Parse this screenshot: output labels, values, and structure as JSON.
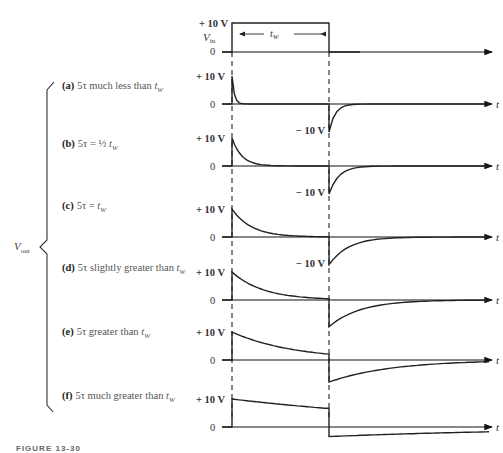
{
  "figure": {
    "caption_partial": "FIGURE 13-30",
    "time_axis_label": "t",
    "input": {
      "label": "V",
      "label_sub": "in",
      "high_label": "+ 10 V",
      "zero_label": "0",
      "width_label": "t",
      "width_label_sub": "W"
    },
    "output_label": "V",
    "output_label_sub": "out",
    "cases": [
      {
        "letter": "(a)",
        "text_pre": "5τ much less than ",
        "var": "t",
        "var_sub": "W",
        "high_label": "+ 10 V",
        "zero_label": "0",
        "neg_label": "− 10 V",
        "ratio": 0.12
      },
      {
        "letter": "(b)",
        "text_pre": "5τ  =  ½ ",
        "var": "t",
        "var_sub": "W",
        "high_label": "+ 10 V",
        "zero_label": "0",
        "neg_label": "− 10 V",
        "ratio": 0.5
      },
      {
        "letter": "(c)",
        "text_pre": "5τ  =  ",
        "var": "t",
        "var_sub": "W",
        "high_label": "+ 10 V",
        "zero_label": "0",
        "neg_label": "− 10 V",
        "ratio": 1.0
      },
      {
        "letter": "(d)",
        "text_pre": "5τ slightly greater than ",
        "var": "t",
        "var_sub": "W",
        "high_label": "+ 10 V",
        "zero_label": "0",
        "neg_label": "",
        "ratio": 1.6
      },
      {
        "letter": "(e)",
        "text_pre": "5τ greater than ",
        "var": "t",
        "var_sub": "W",
        "high_label": "+ 10 V",
        "zero_label": "0",
        "neg_label": "",
        "ratio": 3.2
      },
      {
        "letter": "(f)",
        "text_pre": "5τ much greater than ",
        "var": "t",
        "var_sub": "W",
        "high_label": "+ 10 V",
        "zero_label": "0",
        "neg_label": "",
        "ratio": 12
      }
    ]
  },
  "chart_data": {
    "type": "line",
    "xlabel": "t",
    "ylabel": "V",
    "series": [
      {
        "name": "Vin",
        "description": "rectangular pulse 0 → +10 V for duration tW, then back to 0"
      },
      {
        "name": "(a) 5τ much less than tW",
        "peak_v": 10,
        "neg_peak_v": -10,
        "decays_to_zero_within_pulse": true
      },
      {
        "name": "(b) 5τ = ½ tW",
        "peak_v": 10,
        "neg_peak_v": -10,
        "decays_to_zero_within_pulse": true
      },
      {
        "name": "(c) 5τ = tW",
        "peak_v": 10,
        "neg_peak_v": -10,
        "decays_to_zero_within_pulse": true
      },
      {
        "name": "(d) 5τ slightly greater than tW",
        "peak_v": 10,
        "decays_to_zero_within_pulse": false
      },
      {
        "name": "(e) 5τ greater than tW",
        "peak_v": 10,
        "decays_to_zero_within_pulse": false
      },
      {
        "name": "(f) 5τ much greater than tW",
        "peak_v": 10,
        "decays_to_zero_within_pulse": false
      }
    ],
    "annotations": [
      "+10 V",
      "0",
      "−10 V",
      "tW"
    ]
  }
}
